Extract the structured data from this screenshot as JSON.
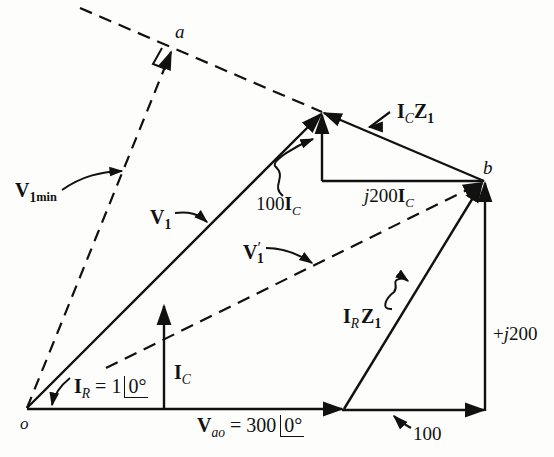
{
  "diagram": {
    "type": "phasor-diagram",
    "points": {
      "origin": "o",
      "perpendicular_foot": "a",
      "point_b": "b"
    },
    "labels": {
      "v1min_main": "V",
      "v1min_sub1": "1",
      "v1min_sub2": "min",
      "v1_main": "V",
      "v1_sub": "1",
      "v1prime_main": "V",
      "v1prime_sup": "′",
      "v1prime_sub": "1",
      "ir_main": "I",
      "ir_sub": "R",
      "ir_eq": " = 1",
      "ir_angle": "0°",
      "ic_main": "I",
      "ic_sub": "C",
      "vao_main": "V",
      "vao_sub": "ao",
      "vao_eq": " = 300",
      "vao_angle": "0°",
      "hundred_ic_num": "100",
      "hundred_ic_I": "I",
      "hundred_ic_sub": "C",
      "j200ic_j": "j",
      "j200ic_num": "200",
      "j200ic_I": "I",
      "j200ic_sub": "C",
      "iczl_I": "I",
      "iczl_sub": "C",
      "iczl_Z": "Z",
      "iczl_zsub": "1",
      "irz1_I": "I",
      "irz1_sub": "R",
      "irz1_Z": "Z",
      "irz1_zsub": "1",
      "plus_j200_sign": "+",
      "plus_j200_j": "j",
      "plus_j200_num": "200",
      "hundred": "100"
    },
    "colors": {
      "ink": "#111111",
      "paper": "#fdfdfc"
    }
  }
}
